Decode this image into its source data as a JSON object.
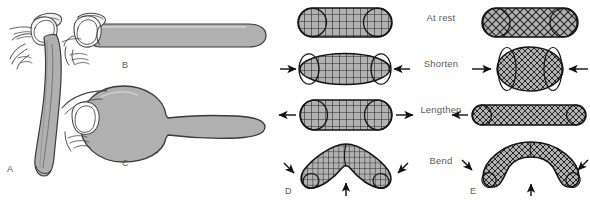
{
  "figure": {
    "background_color": "#ffffff",
    "panel_letters": [
      {
        "id": "A",
        "label": "A",
        "x": 7,
        "y": 164
      },
      {
        "id": "B",
        "label": "B",
        "x": 122,
        "y": 60
      },
      {
        "id": "C",
        "label": "C",
        "x": 122,
        "y": 158
      },
      {
        "id": "D",
        "label": "D",
        "x": 285,
        "y": 186
      },
      {
        "id": "E",
        "label": "E",
        "x": 470,
        "y": 186
      }
    ],
    "row_labels": [
      {
        "key": "at_rest",
        "label": "At rest",
        "y": 12
      },
      {
        "key": "shorten",
        "label": "Shorten",
        "y": 58
      },
      {
        "key": "lengthen",
        "label": "Lengthen",
        "y": 104
      },
      {
        "key": "bend",
        "label": "Bend",
        "y": 155
      }
    ],
    "colors": {
      "balloon_fill": "#b3b3b3",
      "balloon_stroke": "#3a3a3a",
      "mesh_fill": "#b0b0b0",
      "mesh_line": "#2b2b2b",
      "outline": "#1a1a1a",
      "hand_stroke": "#4a4a4a",
      "text": "#5a5a5a",
      "arrow": "#111111"
    },
    "panels": {
      "A": {
        "letter": "A",
        "description": "hand holding limp deflated balloon hanging down",
        "state": "deflated"
      },
      "B": {
        "letter": "B",
        "description": "hand holding inflated long cylindrical balloon",
        "state": "inflated-cylinder"
      },
      "C": {
        "letter": "C",
        "description": "hand holding balloon with large bulbous rounded end",
        "state": "inflated-bulbous"
      },
      "D": {
        "letter": "D",
        "mesh_type": "rectangular-orthogonal",
        "description": "cylinder with orthogonal rectangular mesh reinforcement"
      },
      "E": {
        "letter": "E",
        "mesh_type": "helical-crossed",
        "description": "cylinder with crossed helical fiber mesh reinforcement"
      }
    },
    "states": {
      "D": [
        {
          "key": "at_rest",
          "label": "At rest",
          "arrows": "none",
          "rx": 47,
          "ry": 14,
          "cx": 344,
          "cy": 22
        },
        {
          "key": "shorten",
          "label": "Shorten",
          "arrows": "inward",
          "rx": 45,
          "ry": 15,
          "cx": 344,
          "cy": 68
        },
        {
          "key": "lengthen",
          "label": "Lengthen",
          "arrows": "outward",
          "rx": 47,
          "ry": 15,
          "cx": 344,
          "cy": 114
        },
        {
          "key": "bend",
          "label": "Bend",
          "arrows": "bend",
          "shape": "sharp-v",
          "cx": 344,
          "cy": 165
        }
      ],
      "E": [
        {
          "key": "at_rest",
          "label": "At rest",
          "arrows": "none",
          "rx": 48,
          "ry": 14,
          "cx": 530,
          "cy": 22
        },
        {
          "key": "shorten",
          "label": "Shorten",
          "arrows": "inward",
          "rx": 33,
          "ry": 22,
          "cx": 530,
          "cy": 68
        },
        {
          "key": "lengthen",
          "label": "Lengthen",
          "arrows": "outward",
          "rx": 57,
          "ry": 10,
          "cx": 528,
          "cy": 114
        },
        {
          "key": "bend",
          "label": "Bend",
          "arrows": "bend",
          "shape": "smooth-crescent",
          "cx": 530,
          "cy": 165
        }
      ]
    },
    "arrow_glyphs": {
      "left": "←",
      "right": "→",
      "diagonal_down_right": "↘",
      "diagonal_down_left": "↙",
      "up": "↑"
    }
  }
}
